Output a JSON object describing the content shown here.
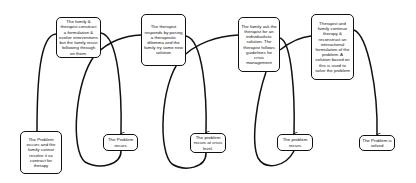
{
  "diagram": {
    "type": "flowchart",
    "top_steps": [
      {
        "id": "t1",
        "text": "The family & therapist construct a formulation & evolve interventions but the family resist following through on them."
      },
      {
        "id": "t2",
        "text": "The therapist responds by posing a therapeutic dilemma and the family try some new solution"
      },
      {
        "id": "t3",
        "text": "The family ask the therapist for an individualistic solution. The therapist follows guidelines for crisis management"
      },
      {
        "id": "t4",
        "text": "Therapist and family continue therapy & reconstruct an interactional formulation of the problem. A solution based on this is used to solve the problem"
      }
    ],
    "bottom_steps": [
      {
        "id": "b1",
        "text": "The Problem occurs and the family cannot resolve it so contract for therapy"
      },
      {
        "id": "b2",
        "text": "The Problem recurs"
      },
      {
        "id": "b3",
        "text": "The problem recurs at crisis level."
      },
      {
        "id": "b4",
        "text": "The problem recurs"
      },
      {
        "id": "b5",
        "text": "The Problem is solved"
      }
    ],
    "colors": {
      "stroke": "#111111",
      "background": "#ffffff"
    }
  }
}
